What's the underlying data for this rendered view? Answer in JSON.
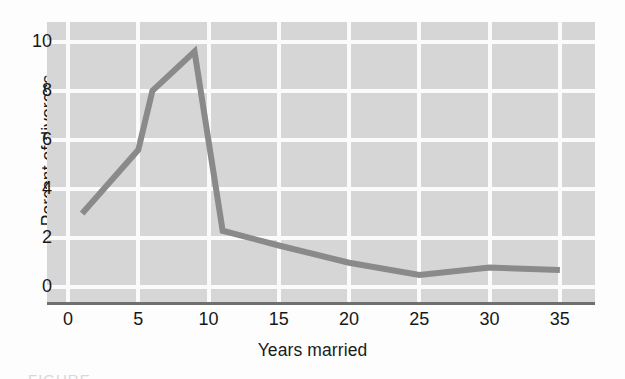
{
  "figure": {
    "caption_sliver": "FIGURE"
  },
  "chart_data": {
    "type": "line",
    "title": "",
    "xlabel": "Years married",
    "ylabel": "Percent of divorces",
    "xlim": [
      -1.5,
      37.5
    ],
    "ylim": [
      -0.6,
      10.8
    ],
    "xticks": [
      0,
      5,
      10,
      15,
      20,
      25,
      30,
      35
    ],
    "xtick_labels": [
      "0",
      "5",
      "10",
      "15",
      "20",
      "25",
      "30",
      "35"
    ],
    "yticks": [
      0,
      2,
      4,
      6,
      8,
      10
    ],
    "ytick_labels": [
      "0",
      "2",
      "4",
      "6",
      "8",
      "10"
    ],
    "grid": true,
    "grid_color": "#fbfbfb",
    "plot_background": "#d6d6d6",
    "legend": false,
    "series": [
      {
        "name": "Percent of divorces",
        "color": "#8a8a8a",
        "line_width": 6,
        "x": [
          1.0,
          5.0,
          6.0,
          9.0,
          11.0,
          15.0,
          20.0,
          25.0,
          30.0,
          35.0
        ],
        "values": [
          3.0,
          5.6,
          8.0,
          9.6,
          2.3,
          1.7,
          1.0,
          0.5,
          0.8,
          0.7
        ]
      }
    ]
  }
}
